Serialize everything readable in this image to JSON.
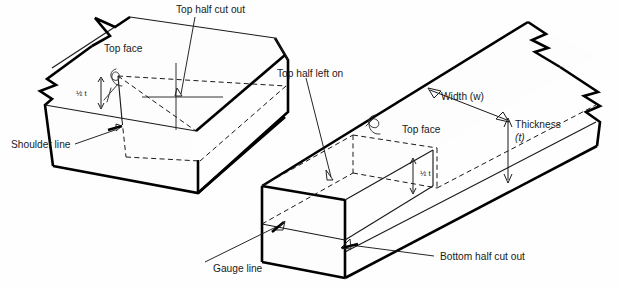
{
  "figure": {
    "background_color": "#ffffff",
    "line_color": "#000000",
    "text_color": "#1a1a1a",
    "hidden_line_style": "dashed"
  },
  "labels": {
    "top_half_cut_out": "Top half cut out",
    "top_face_left": "Top face",
    "half_t_left": "½ t",
    "shoulder_line": "Shoulder line",
    "top_half_left_on": "Top half left on",
    "top_face_right": "Top face",
    "width": "Width (w)",
    "thickness": "Thickness",
    "thickness_symbol": "(t)",
    "half_t_right": "½ t",
    "gauge_line": "Gauge line",
    "bottom_half_cut_out": "Bottom half cut out"
  },
  "annotations": [
    {
      "name": "top-half-cut-out",
      "text": "Top half cut out",
      "target": "left-board-top-face-cross"
    },
    {
      "name": "shoulder-line",
      "text": "Shoulder line",
      "target": "left-board-shoulder-edge"
    },
    {
      "name": "top-half-left-on",
      "text": "Top half left on",
      "target": "right-board-remaining-half"
    },
    {
      "name": "gauge-line",
      "text": "Gauge line",
      "target": "right-board-gauge-edge"
    },
    {
      "name": "bottom-half-cut-out",
      "text": "Bottom half cut out",
      "target": "right-board-bottom-cut"
    },
    {
      "name": "width-dimension",
      "text": "Width (w)",
      "target": "right-board-width"
    },
    {
      "name": "thickness-dimension",
      "text": "Thickness",
      "target": "right-board-thickness"
    }
  ],
  "dimensions": [
    {
      "name": "half-thickness-left",
      "label": "½ t",
      "board": "left"
    },
    {
      "name": "half-thickness-right",
      "label": "½ t",
      "board": "right"
    },
    {
      "name": "full-thickness-right",
      "label": "Thickness (t)",
      "board": "right"
    },
    {
      "name": "width-right",
      "label": "Width (w)",
      "board": "right"
    }
  ],
  "boards": [
    {
      "name": "left-board",
      "description": "Board with top half cut out, shown with break lines at left end",
      "faces": [
        "Top face"
      ],
      "features": [
        "shoulder line",
        "half-thickness step",
        "cross mark on waste"
      ]
    },
    {
      "name": "right-board",
      "description": "Board with top half left on and bottom half cut out",
      "faces": [
        "Top face"
      ],
      "features": [
        "gauge line",
        "half-thickness step",
        "width dimension",
        "thickness dimension"
      ]
    }
  ]
}
